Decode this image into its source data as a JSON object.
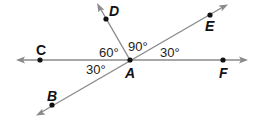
{
  "diagram": {
    "type": "angle-diagram",
    "colors": {
      "line": "#8a8a8a",
      "point": "#111111",
      "text": "#111111"
    },
    "vertex": {
      "label": "A",
      "x": 130,
      "y": 60
    },
    "points": [
      {
        "label": "C",
        "x": 40,
        "y": 60
      },
      {
        "label": "F",
        "x": 223,
        "y": 60
      },
      {
        "label": "D",
        "x": 106,
        "y": 19
      },
      {
        "label": "E",
        "x": 210,
        "y": 15
      },
      {
        "label": "B",
        "x": 52,
        "y": 105
      }
    ],
    "lines": [
      {
        "name": "line CF",
        "through": [
          "C",
          "A",
          "F"
        ]
      },
      {
        "name": "line BE",
        "through": [
          "B",
          "A",
          "E"
        ]
      },
      {
        "name": "ray AD",
        "through": [
          "A",
          "D"
        ]
      }
    ],
    "angles": [
      {
        "label": "60°",
        "between": [
          "C",
          "D"
        ]
      },
      {
        "label": "90°",
        "between": [
          "D",
          "E"
        ]
      },
      {
        "label": "30°",
        "between": [
          "E",
          "F"
        ]
      },
      {
        "label": "30°",
        "between": [
          "C",
          "B"
        ]
      }
    ]
  }
}
